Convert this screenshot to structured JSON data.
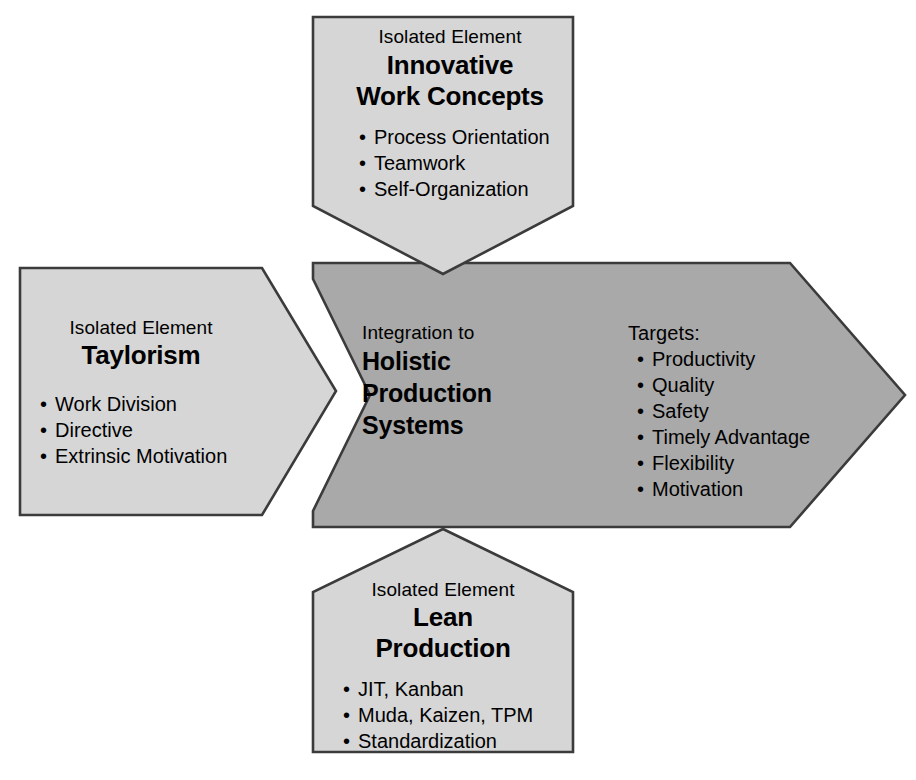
{
  "diagram": {
    "title": "Integration to Holistic Production Systems",
    "colors": {
      "light_fill": "#d6d6d6",
      "dark_fill": "#a9a9a9",
      "stroke": "#3b3b3b",
      "text": "#000000",
      "background": "#ffffff"
    }
  },
  "top": {
    "shape": "down-pointing-pentagon",
    "eyebrow": "Isolated Element",
    "heading_line1": "Innovative",
    "heading_line2": "Work Concepts",
    "bullets": [
      "Process Orientation",
      "Teamwork",
      "Self-Organization"
    ]
  },
  "left": {
    "shape": "right-pointing-arrow",
    "eyebrow": "Isolated Element",
    "heading_line1": "Taylorism",
    "bullets": [
      "Work Division",
      "Directive",
      "Extrinsic Motivation"
    ]
  },
  "center": {
    "shape": "right-pointing-arrow-with-notch",
    "eyebrow": "Integration to",
    "heading_line1": "Holistic",
    "heading_line2": "Production",
    "heading_line3": "Systems"
  },
  "right": {
    "label": "Targets:",
    "bullets": [
      "Productivity",
      "Quality",
      "Safety",
      "Timely Advantage",
      "Flexibility",
      "Motivation"
    ]
  },
  "bottom": {
    "shape": "up-pointing-pentagon",
    "eyebrow": "Isolated Element",
    "heading_line1": "Lean",
    "heading_line2": "Production",
    "bullets": [
      "JIT, Kanban",
      "Muda, Kaizen, TPM",
      "Standardization"
    ]
  }
}
